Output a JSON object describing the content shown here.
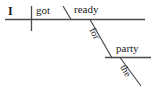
{
  "diagram": {
    "type": "reed-kellogg-sentence-diagram",
    "sentence": "I got ready for the party",
    "line_color": "#4a4a4a",
    "text_color": "#1a1a1a",
    "background_color": "#ffffff",
    "words": {
      "subject": "I",
      "verb": "got",
      "predicate_adjective": "ready",
      "preposition": "for",
      "object_of_preposition": "party",
      "article": "the"
    },
    "lines": {
      "main_baseline": "horizontal baseline",
      "subject_verb_divider": "vertical divider",
      "predicate_slant": "backslash",
      "preposition_diagonal": "slanted line",
      "prepositional_baseline": "horizontal baseline",
      "article_diagonal": "slanted line"
    }
  }
}
